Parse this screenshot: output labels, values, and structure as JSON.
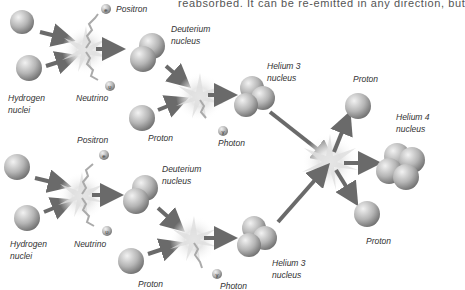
{
  "top_text": "reabsorbed. It can be re-emitted in any direction, but",
  "labels": {
    "positron_1": "Positron",
    "neutrino_1": "Neutrino",
    "hydrogen_1": "Hydrogen\nnuclei",
    "deuterium_1": "Deuterium\nnucleus",
    "proton_1": "Proton",
    "photon_1": "Photon",
    "helium3_1": "Helium 3\nnucleus",
    "proton_top": "Proton",
    "helium4": "Helium 4\nnucleus",
    "proton_bottom": "Proton",
    "positron_2": "Positron",
    "neutrino_2": "Neutrino",
    "hydrogen_2": "Hydrogen\nnuclei",
    "deuterium_2": "Deuterium\nnucleus",
    "proton_2": "Proton",
    "photon_2": "Photon",
    "helium3_2": "Helium 3\nnucleus"
  },
  "particle_symbols": {
    "positron": "e",
    "neutrino": "υ",
    "photon": "γ"
  },
  "colors": {
    "sphere_light": "#e8e8e8",
    "sphere_dark": "#7a7a7a",
    "arrow": "#6a6a6a",
    "flash": "#d0d0d0"
  }
}
